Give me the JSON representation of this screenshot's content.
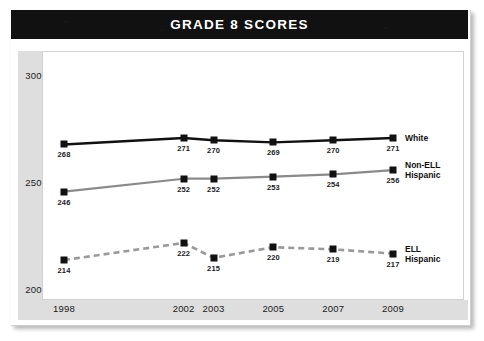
{
  "banner": {
    "title": "GRADE 8 SCORES"
  },
  "chart_data": {
    "type": "line",
    "title": "GRADE 8 SCORES",
    "xlabel": "",
    "ylabel": "",
    "x": [
      1998,
      2002,
      2003,
      2005,
      2007,
      2009
    ],
    "categories": [
      "1998",
      "2002",
      "2003",
      "2005",
      "2007",
      "2009"
    ],
    "ylim": [
      200,
      300
    ],
    "yticks": [
      200,
      250,
      300
    ],
    "ytick_labels": [
      "200",
      "250",
      "300"
    ],
    "grid": false,
    "legend_position": "right-inline",
    "series": [
      {
        "name": "White",
        "label": "White",
        "color": "#111111",
        "style": "solid",
        "values": [
          268,
          271,
          270,
          269,
          270,
          271
        ],
        "value_labels": [
          "268",
          "271",
          "270",
          "269",
          "270",
          "271"
        ]
      },
      {
        "name": "Non-ELL Hispanic",
        "label": "Non-ELL\nHispanic",
        "color": "#8a8a8a",
        "style": "solid",
        "values": [
          246,
          252,
          252,
          253,
          254,
          256
        ],
        "value_labels": [
          "246",
          "252",
          "252",
          "253",
          "254",
          "256"
        ]
      },
      {
        "name": "ELL Hispanic",
        "label": "ELL\nHispanic",
        "color": "#9a9a9a",
        "style": "dashed",
        "values": [
          214,
          222,
          215,
          220,
          219,
          217
        ],
        "value_labels": [
          "214",
          "222",
          "215",
          "220",
          "219",
          "217"
        ]
      }
    ]
  },
  "colors": {
    "banner_bg": "#111111",
    "banner_text": "#ffffff",
    "axis_band": "#dedede",
    "plot_bg": "#ffffff",
    "white_series": "#111111",
    "nonell_series": "#8a8a8a",
    "ell_series": "#9a9a9a"
  }
}
